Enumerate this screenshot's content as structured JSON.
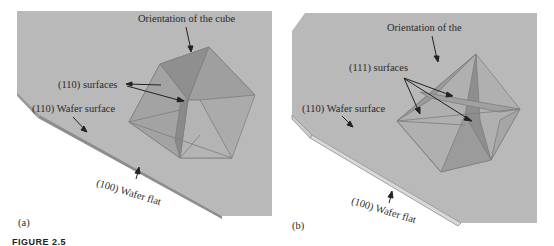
{
  "figure": {
    "caption_fragment": "FIGURE 2.5",
    "panels": [
      {
        "id": "a",
        "panel_label": "(a)",
        "title_label": "Orientation of the cube",
        "surface_label": "(110) surfaces",
        "wafer_surface_label": "(110) Wafer surface",
        "wafer_flat_label": "(100) Wafer flat"
      },
      {
        "id": "b",
        "panel_label": "(b)",
        "title_label": "Orientation of the",
        "surface_label": "(111) surfaces",
        "wafer_surface_label": "(110) Wafer surface",
        "wafer_flat_label": "(100) Wafer flat"
      }
    ],
    "colors": {
      "wafer_fill": "#b9b9b9",
      "wafer_edge": "#8a8a8a",
      "face_dark": "#8f8f8f",
      "face_mid": "#a5a5a5",
      "face_light": "#bdbdbd",
      "text": "#2b2b2b"
    }
  }
}
